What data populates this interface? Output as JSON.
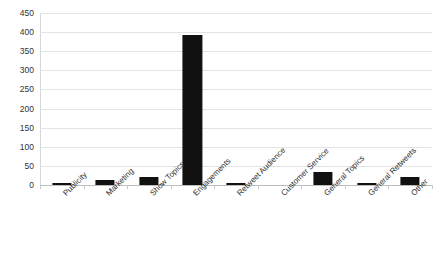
{
  "chart_data": {
    "type": "bar",
    "title": "",
    "subtitle": "",
    "xlabel": "",
    "ylabel": "",
    "ylim": [
      0,
      450
    ],
    "ytick_step": 50,
    "yticks": [
      0,
      50,
      100,
      150,
      200,
      250,
      300,
      350,
      400,
      450
    ],
    "grid": true,
    "legend": false,
    "legend_position": "none",
    "bar_color": "#111111",
    "gridline_color": "#e3e3e3",
    "axis_color": "#bdbdbd",
    "background": "#ffffff",
    "categories": [
      "Publicity",
      "Marketing",
      "Show Topics",
      "Engagements",
      "Retweet Audience",
      "Customer Service",
      "General Topics",
      "General Retweets",
      "Other"
    ],
    "values": [
      6,
      13,
      20,
      392,
      5,
      0,
      33,
      4,
      20
    ]
  }
}
